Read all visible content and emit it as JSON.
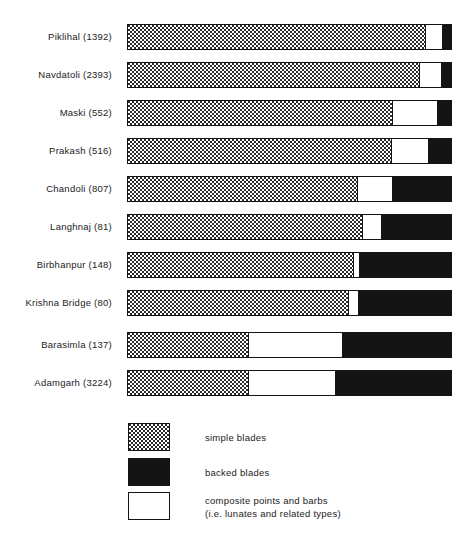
{
  "chart_data": {
    "type": "bar",
    "subtype": "stacked-horizontal-100pct",
    "title": "",
    "subtitle": "",
    "xlabel": "",
    "ylabel": "",
    "xlim": [
      0,
      100
    ],
    "grid": false,
    "legend_position": "bottom-left",
    "units": "percent of assemblage",
    "categories": [
      "Piklihal (1392)",
      "Navdatoli (2393)",
      "Maski (552)",
      "Prakash (516)",
      "Chandoli (807)",
      "Langhnaj (81)",
      "Birbhanpur (148)",
      "Krishna Bridge (80)",
      "Barasimla (137)",
      "Adamgarh (3224)"
    ],
    "series": [
      {
        "name": "simple blades",
        "key": "simple",
        "color": "#ffffff",
        "pattern": "stipple-dots",
        "values": [
          92.0,
          90.2,
          81.8,
          81.5,
          70.8,
          72.6,
          69.8,
          68.0,
          37.2,
          37.2
        ]
      },
      {
        "name": "composite points and barbs",
        "key": "composite",
        "color": "#ffffff",
        "pattern": "solid-white",
        "values": [
          5.2,
          6.8,
          13.8,
          11.4,
          10.8,
          5.8,
          1.6,
          3.1,
          29.2,
          26.8
        ]
      },
      {
        "name": "backed blades",
        "key": "backed",
        "color": "#141414",
        "pattern": "solid-black",
        "values": [
          2.8,
          3.0,
          4.4,
          7.1,
          18.4,
          21.6,
          28.6,
          28.9,
          33.6,
          36.0
        ]
      }
    ],
    "annotations": []
  },
  "rows": [
    {
      "label": "Piklihal (1392)",
      "site": "Piklihal",
      "count": "1392",
      "simple_pct": 92.0,
      "composite_pct": 5.2,
      "backed_pct": 2.8
    },
    {
      "label": "Navdatoli (2393)",
      "site": "Navdatoli",
      "count": "2393",
      "simple_pct": 90.2,
      "composite_pct": 6.8,
      "backed_pct": 3.0
    },
    {
      "label": "Maski (552)",
      "site": "Maski",
      "count": "552",
      "simple_pct": 81.8,
      "composite_pct": 13.8,
      "backed_pct": 4.4
    },
    {
      "label": "Prakash (516)",
      "site": "Prakash",
      "count": "516",
      "simple_pct": 81.5,
      "composite_pct": 11.4,
      "backed_pct": 7.1
    },
    {
      "label": "Chandoli (807)",
      "site": "Chandoli",
      "count": "807",
      "simple_pct": 70.8,
      "composite_pct": 10.8,
      "backed_pct": 18.4
    },
    {
      "label": "Langhnaj (81)",
      "site": "Langhnaj",
      "count": "81",
      "simple_pct": 72.6,
      "composite_pct": 5.8,
      "backed_pct": 21.6
    },
    {
      "label": "Birbhanpur (148)",
      "site": "Birbhanpur",
      "count": "148",
      "simple_pct": 69.8,
      "composite_pct": 1.6,
      "backed_pct": 28.6
    },
    {
      "label": "Krishna Bridge (80)",
      "site": "Krishna Bridge",
      "count": "80",
      "simple_pct": 68.0,
      "composite_pct": 3.1,
      "backed_pct": 28.9
    },
    {
      "label": "Barasimla (137)",
      "site": "Barasimla",
      "count": "137",
      "simple_pct": 37.2,
      "composite_pct": 29.2,
      "backed_pct": 33.6
    },
    {
      "label": "Adamgarh (3224)",
      "site": "Adamgarh",
      "count": "3224",
      "simple_pct": 37.2,
      "composite_pct": 26.8,
      "backed_pct": 36.0
    }
  ],
  "legend": {
    "items": [
      {
        "swatch": "simple",
        "label": "simple blades",
        "label2": ""
      },
      {
        "swatch": "backed",
        "label": "backed blades",
        "label2": ""
      },
      {
        "swatch": "composite",
        "label": "composite points and barbs",
        "label2": "(i.e. lunates and related types)"
      }
    ]
  },
  "colors": {
    "ink": "#141414",
    "paper": "#ffffff",
    "backed_blades": "#141414",
    "simple_blades": "#ffffff",
    "composite": "#ffffff"
  }
}
